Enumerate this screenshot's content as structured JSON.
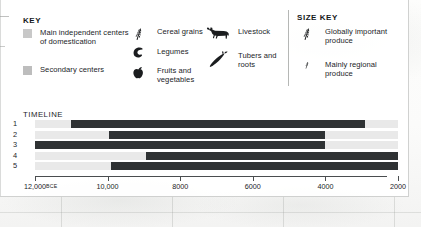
{
  "key": {
    "title": "KEY",
    "items": [
      {
        "name": "main-centers",
        "marker": "swatch",
        "color": "#c8c8c8",
        "label": "Main independent centers of domestication"
      },
      {
        "name": "secondary-centers",
        "marker": "swatch",
        "color": "#bdbdbd",
        "label": "Secondary centers"
      },
      {
        "name": "cereal-grains",
        "marker": "wheat-icon",
        "label": "Cereal grains"
      },
      {
        "name": "legumes",
        "marker": "bean-icon",
        "label": "Legumes"
      },
      {
        "name": "fruits-vegetables",
        "marker": "apple-icon",
        "label": "Fruits and vegetables"
      },
      {
        "name": "livestock",
        "marker": "cow-icon",
        "label": "Livestock"
      },
      {
        "name": "tubers-roots",
        "marker": "carrot-icon",
        "label": "Tubers and roots"
      }
    ]
  },
  "size_key": {
    "title": "SIZE KEY",
    "items": [
      {
        "name": "globally-important",
        "marker": "wheat-large-icon",
        "label": "Globally important produce"
      },
      {
        "name": "mainly-regional",
        "marker": "wheat-small-icon",
        "label": "Mainly regional produce"
      }
    ]
  },
  "timeline": {
    "title": "TIMELINE",
    "colors": {
      "bar": "#2f3234",
      "track": "#e9e9e9"
    },
    "axis": {
      "min": 12000,
      "max": 2000,
      "direction": "descending",
      "ticks": [
        {
          "value": 12000,
          "label": "12,000",
          "suffix": "BCE"
        },
        {
          "value": 10000,
          "label": "10,000",
          "suffix": ""
        },
        {
          "value": 8000,
          "label": "8000",
          "suffix": ""
        },
        {
          "value": 6000,
          "label": "6000",
          "suffix": ""
        },
        {
          "value": 4000,
          "label": "4000",
          "suffix": ""
        },
        {
          "value": 2000,
          "label": "2000",
          "suffix": ""
        }
      ]
    },
    "rows": [
      {
        "label": "1",
        "start": 11000,
        "end": 2900
      },
      {
        "label": "2",
        "start": 9950,
        "end": 4000
      },
      {
        "label": "3",
        "start": 12000,
        "end": 4000
      },
      {
        "label": "4",
        "start": 8950,
        "end": 2000
      },
      {
        "label": "5",
        "start": 9900,
        "end": 2000
      }
    ]
  }
}
